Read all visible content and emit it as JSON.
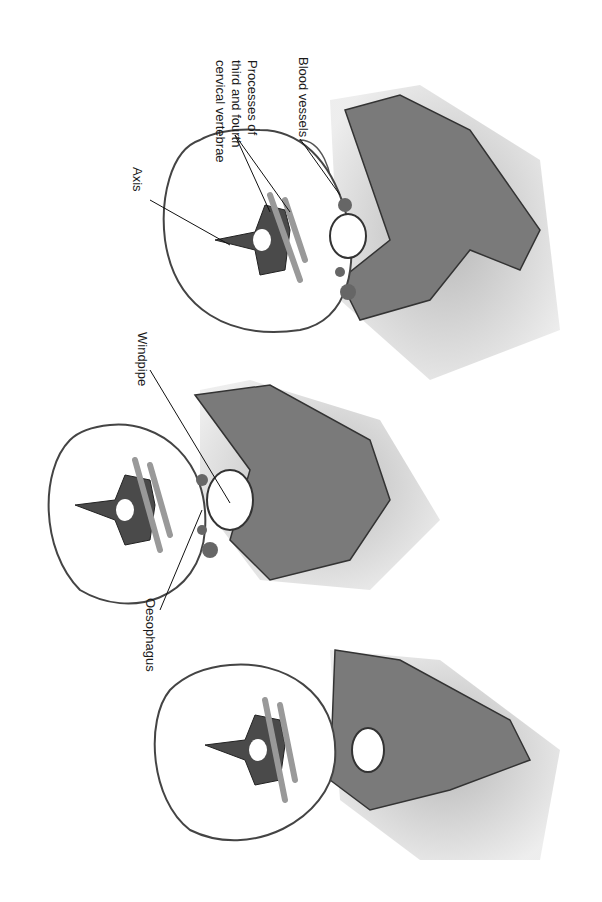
{
  "figure": {
    "orientation": "rotated 90 degrees clockwise",
    "panels": [
      {
        "id": "top",
        "labels": [
          "Blood vessels",
          "Processes of third and fourth cervical vertebrae",
          "Axis"
        ]
      },
      {
        "id": "middle",
        "labels": [
          "Windpipe",
          "Oesophagus"
        ]
      },
      {
        "id": "bottom",
        "labels": []
      }
    ]
  },
  "labels": {
    "blood_vessels": "Blood vessels",
    "processes_line1": "Processes of",
    "processes_line2": "third and fourth",
    "processes_line3": "cervical vertebrae",
    "axis": "Axis",
    "windpipe": "Windpipe",
    "oesophagus": "Oesophagus"
  },
  "colors": {
    "bone": "#6e6e6e",
    "vertebra": "#4a4a4a",
    "skin": "#b5b5b5",
    "outline": "#333333",
    "background": "#ffffff"
  }
}
